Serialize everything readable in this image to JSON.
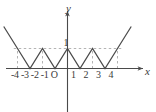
{
  "figure": {
    "title": "",
    "background_color": "#ffffff",
    "curve_color": "#4a4a4a",
    "axis_color": "#4a4a4a",
    "guide_color": "#b0b0b0",
    "text_color": "#3a3a3a"
  },
  "labels": {
    "y_axis": "y",
    "x_axis": "x",
    "y_tick_1": "1",
    "x_ticks_left": "-4 -3 -2 -1 O",
    "x_ticks_right": "1   2   3   4"
  },
  "chart_data": {
    "type": "line",
    "title": "",
    "xlabel": "x",
    "ylabel": "y",
    "xlim": [
      -5.5,
      5.5
    ],
    "ylim": [
      -2.2,
      2.2
    ],
    "grid": false,
    "legend": false,
    "x_tick_values": [
      -4,
      -3,
      -2,
      -1,
      0,
      1,
      2,
      3,
      4
    ],
    "x_tick_labels": [
      "-4",
      "-3",
      "-2",
      "-1",
      "O",
      "1",
      "2",
      "3",
      "4"
    ],
    "y_tick_values": [
      1
    ],
    "y_tick_labels": [
      "1"
    ],
    "series": [
      {
        "name": "triangle wave",
        "x": [
          -5.1,
          -4,
          -3,
          -2,
          -1,
          0,
          1,
          2,
          3,
          4,
          5.1
        ],
        "y": [
          2.1,
          1,
          0,
          1,
          0,
          1,
          0,
          1,
          0,
          1,
          2.1
        ]
      }
    ],
    "annotations": [
      {
        "kind": "dashed-horizontal",
        "y": 1,
        "x_from": -4.3,
        "x_to": 4.3
      },
      {
        "kind": "dashed-vertical",
        "x": -4,
        "y_from": 0,
        "y_to": 1
      },
      {
        "kind": "dashed-vertical",
        "x": -2,
        "y_from": 0,
        "y_to": 1
      },
      {
        "kind": "dashed-vertical",
        "x": 2,
        "y_from": 0,
        "y_to": 1
      },
      {
        "kind": "dashed-vertical",
        "x": 4,
        "y_from": 0,
        "y_to": 1
      }
    ]
  }
}
